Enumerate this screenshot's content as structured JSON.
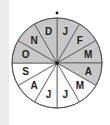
{
  "diagram": {
    "type": "month-wheel",
    "center": [
      57,
      63
    ],
    "radius": 45,
    "colors": {
      "shaded": "#c8c8c8",
      "unshaded": "#ffffff",
      "line": "#555555"
    },
    "sectors": [
      {
        "label": "J",
        "shaded": true
      },
      {
        "label": "F",
        "shaded": true
      },
      {
        "label": "M",
        "shaded": true
      },
      {
        "label": "A",
        "shaded": true
      },
      {
        "label": "M",
        "shaded": false
      },
      {
        "label": "J",
        "shaded": false
      },
      {
        "label": "J",
        "shaded": false
      },
      {
        "label": "A",
        "shaded": false
      },
      {
        "label": "S",
        "shaded": false
      },
      {
        "label": "O",
        "shaded": true
      },
      {
        "label": "N",
        "shaded": true
      },
      {
        "label": "D",
        "shaded": true
      }
    ]
  }
}
